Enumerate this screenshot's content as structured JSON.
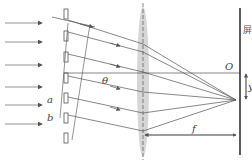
{
  "diagram": {
    "labels": {
      "screen": "屏",
      "origin": "O",
      "angle": "θ",
      "focal_length": "f",
      "displacement": "y",
      "slit_a": "a",
      "slit_b": "b"
    },
    "colors": {
      "line": "#555555",
      "lens_fill": "#cccccc",
      "screen": "#333333"
    },
    "incident_rays_y": [
      13,
      38,
      63,
      88,
      112,
      136
    ],
    "slits_y": [
      10,
      32,
      54,
      76,
      98,
      120,
      142
    ]
  }
}
